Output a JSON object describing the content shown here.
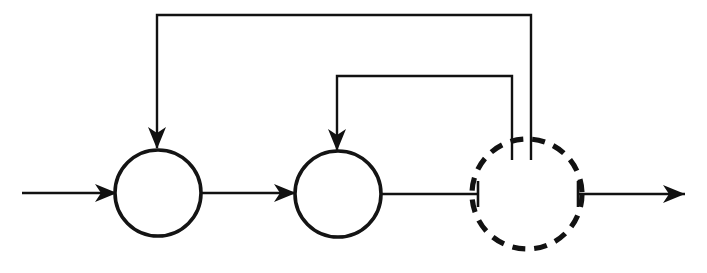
{
  "figure": {
    "kind": "block-diagram",
    "background_color": "#ffffff",
    "line_color": "#111111",
    "canvas": {
      "width": 707,
      "height": 273
    }
  },
  "nodes": [
    {
      "id": "summing-junction-1",
      "label": "",
      "shape": "circle",
      "style": "solid",
      "cx": 158,
      "cy": 193,
      "r": 43,
      "stroke_color": "#141414",
      "stroke_width": 3.6
    },
    {
      "id": "summing-junction-2",
      "label": "",
      "shape": "circle",
      "style": "solid",
      "cx": 338,
      "cy": 194,
      "r": 43,
      "stroke_color": "#141414",
      "stroke_width": 3.6
    },
    {
      "id": "lumped-block",
      "label": "",
      "shape": "circle",
      "style": "dashed",
      "cx": 527,
      "cy": 194,
      "r": 55,
      "stroke_color": "#121212",
      "stroke_width": 5.2,
      "dash_pattern": "13 9"
    }
  ],
  "edges": [
    {
      "id": "input-edge",
      "from": "external-input",
      "to": "summing-junction-1",
      "orientation": "horizontal",
      "arrow": "end",
      "path": "M22,193 H117"
    },
    {
      "id": "forward-edge-1",
      "from": "summing-junction-1",
      "to": "summing-junction-2",
      "orientation": "horizontal",
      "arrow": "end",
      "path": "M201,193 H296"
    },
    {
      "id": "forward-edge-2",
      "from": "summing-junction-2",
      "to": "lumped-block",
      "orientation": "horizontal",
      "arrow": "none",
      "path": "M381,194 H478"
    },
    {
      "id": "output-edge",
      "from": "lumped-block",
      "to": "external-output",
      "orientation": "horizontal",
      "arrow": "end",
      "path": "M578,194 H685"
    },
    {
      "id": "outer-feedback-edge",
      "from": "lumped-block",
      "to": "summing-junction-1",
      "orientation": "routed",
      "arrow": "end",
      "path": "M531,160 V15 H157 V148"
    },
    {
      "id": "inner-feedback-edge",
      "from": "lumped-block",
      "to": "summing-junction-2",
      "orientation": "routed",
      "arrow": "end",
      "path": "M512,160 V76 H337 V150"
    }
  ],
  "arrowheads": [
    {
      "id": "input-arrowhead",
      "x": 117,
      "y": 193,
      "direction": "right"
    },
    {
      "id": "forward-1-arrowhead",
      "x": 296,
      "y": 193,
      "direction": "right"
    },
    {
      "id": "output-arrowhead",
      "x": 685,
      "y": 194,
      "direction": "right"
    },
    {
      "id": "outer-feedback-arrowhead",
      "x": 157,
      "y": 149,
      "direction": "down"
    },
    {
      "id": "inner-feedback-arrowhead",
      "x": 337,
      "y": 151,
      "direction": "down"
    }
  ],
  "tick_marks": [
    {
      "id": "left-port-tick",
      "x": 478,
      "y": 194,
      "half_length": 13
    },
    {
      "id": "right-port-tick",
      "x": 578,
      "y": 194,
      "half_length": 13
    }
  ]
}
